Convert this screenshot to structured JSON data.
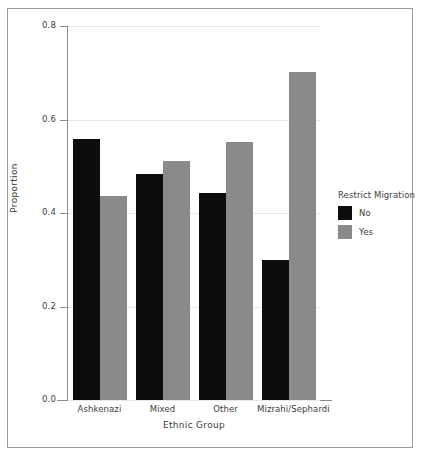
{
  "chart_data": {
    "type": "bar",
    "title": "",
    "xlabel": "Ethnic Group",
    "ylabel": "Proportion",
    "categories": [
      "Ashkenazi",
      "Mixed",
      "Other",
      "Mizrahi/Sephardi"
    ],
    "series": [
      {
        "name": "No",
        "color": "#0d0d0d",
        "values": [
          0.558,
          0.483,
          0.443,
          0.299
        ]
      },
      {
        "name": "Yes",
        "color": "#8a8a8a",
        "values": [
          0.436,
          0.511,
          0.552,
          0.702
        ]
      }
    ],
    "legend_title": "Restrict Migration",
    "legend_position": "right",
    "ylim": [
      0.0,
      0.8
    ],
    "yticks": [
      0.0,
      0.2,
      0.4,
      0.6,
      0.8
    ],
    "ytick_labels": [
      "0.0",
      "0.2",
      "0.4",
      "0.6",
      "0.8"
    ],
    "grid": true,
    "grid_axis": "y"
  },
  "colors": {
    "axis": "#8c8c8c",
    "grid": "#e8e8e8",
    "frame": "#9a9a9a",
    "text": "#3c3c3c",
    "background": "#ffffff"
  }
}
